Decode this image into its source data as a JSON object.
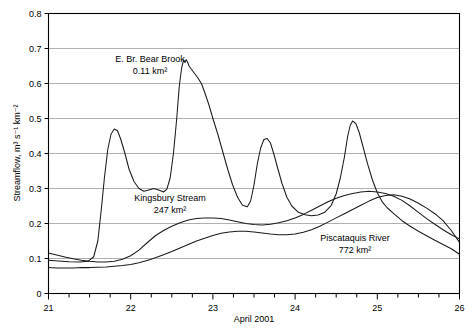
{
  "chart_data": {
    "type": "line",
    "title": "",
    "xlabel": "April 2001",
    "ylabel": "Streamflow, m³ s⁻¹ km⁻²",
    "xlim": [
      21,
      26
    ],
    "ylim": [
      0,
      0.8
    ],
    "xticks": [
      21,
      22,
      23,
      24,
      25,
      26
    ],
    "xtick_labels": [
      "21",
      "22",
      "23",
      "24",
      "25",
      "26"
    ],
    "x_minor_per_major": 4,
    "yticks": [
      0,
      0.1,
      0.2,
      0.3,
      0.4,
      0.5,
      0.6,
      0.7,
      0.8
    ],
    "ytick_labels": [
      "0",
      "0.1",
      "0.2",
      "0.3",
      "0.4",
      "0.5",
      "0.6",
      "0.7",
      "0.8"
    ],
    "grid": "horizontal",
    "legend": "inline-annotations",
    "line_color": "#1a1a1a",
    "grid_color": "#8c8c8c",
    "annotations": [
      {
        "name": "E. Br. Bear Brook",
        "area": "0.11 km²",
        "line1": "E. Br. Bear Brook",
        "line2": "0.11 km²",
        "x_px": 150,
        "y_px": 62
      },
      {
        "name": "Kingsbury Stream",
        "area": "247 km²",
        "line1": "Kingsbury Stream",
        "line2": "247 km²",
        "x_px": 170,
        "y_px": 201
      },
      {
        "name": "Piscataquis River",
        "area": "772 km²",
        "line1": "Piscataquis River",
        "line2": "772 km²",
        "x_px": 355,
        "y_px": 241
      }
    ],
    "series": [
      {
        "name": "E. Br. Bear Brook",
        "area_km2": 0.11,
        "x": [
          21.0,
          21.12,
          21.25,
          21.38,
          21.48,
          21.55,
          21.6,
          21.64,
          21.68,
          21.72,
          21.76,
          21.8,
          21.84,
          21.88,
          21.93,
          21.98,
          22.04,
          22.1,
          22.16,
          22.22,
          22.28,
          22.34,
          22.4,
          22.44,
          22.48,
          22.52,
          22.56,
          22.59,
          22.62,
          22.645,
          22.66,
          22.675,
          22.69,
          22.71,
          22.74,
          22.78,
          22.82,
          22.86,
          22.9,
          22.95,
          23.0,
          23.06,
          23.12,
          23.18,
          23.24,
          23.3,
          23.36,
          23.42,
          23.46,
          23.5,
          23.54,
          23.58,
          23.62,
          23.66,
          23.7,
          23.74,
          23.78,
          23.84,
          23.9,
          23.96,
          24.04,
          24.12,
          24.2,
          24.28,
          24.36,
          24.44,
          24.5,
          24.55,
          24.6,
          24.64,
          24.67,
          24.7,
          24.74,
          24.78,
          24.82,
          24.88,
          24.94,
          25.0,
          25.06,
          25.12,
          25.2,
          25.3,
          25.4,
          25.5,
          25.6,
          25.7,
          25.8,
          25.9,
          26.0
        ],
        "y": [
          0.095,
          0.093,
          0.091,
          0.09,
          0.092,
          0.105,
          0.15,
          0.235,
          0.33,
          0.41,
          0.455,
          0.47,
          0.465,
          0.44,
          0.4,
          0.355,
          0.32,
          0.3,
          0.292,
          0.296,
          0.3,
          0.296,
          0.29,
          0.298,
          0.33,
          0.4,
          0.5,
          0.59,
          0.645,
          0.668,
          0.66,
          0.668,
          0.662,
          0.65,
          0.64,
          0.628,
          0.615,
          0.6,
          0.575,
          0.54,
          0.5,
          0.455,
          0.405,
          0.355,
          0.31,
          0.275,
          0.252,
          0.248,
          0.265,
          0.31,
          0.37,
          0.415,
          0.44,
          0.443,
          0.43,
          0.4,
          0.365,
          0.315,
          0.275,
          0.25,
          0.232,
          0.225,
          0.222,
          0.224,
          0.232,
          0.252,
          0.285,
          0.33,
          0.39,
          0.45,
          0.48,
          0.493,
          0.485,
          0.46,
          0.425,
          0.372,
          0.325,
          0.288,
          0.262,
          0.245,
          0.228,
          0.208,
          0.192,
          0.178,
          0.165,
          0.152,
          0.14,
          0.128,
          0.112
        ]
      },
      {
        "name": "Kingsbury Stream",
        "area_km2": 247,
        "x": [
          21.0,
          21.1,
          21.2,
          21.3,
          21.4,
          21.5,
          21.6,
          21.7,
          21.8,
          21.9,
          22.0,
          22.1,
          22.2,
          22.3,
          22.4,
          22.5,
          22.6,
          22.7,
          22.8,
          22.9,
          23.0,
          23.1,
          23.2,
          23.3,
          23.4,
          23.5,
          23.6,
          23.7,
          23.8,
          23.9,
          24.0,
          24.1,
          24.2,
          24.3,
          24.4,
          24.5,
          24.6,
          24.7,
          24.8,
          24.9,
          25.0,
          25.1,
          25.2,
          25.3,
          25.4,
          25.5,
          25.6,
          25.7,
          25.8,
          25.9,
          26.0
        ],
        "y": [
          0.116,
          0.11,
          0.104,
          0.099,
          0.095,
          0.092,
          0.09,
          0.09,
          0.092,
          0.098,
          0.108,
          0.124,
          0.145,
          0.165,
          0.18,
          0.192,
          0.202,
          0.21,
          0.214,
          0.216,
          0.216,
          0.214,
          0.21,
          0.205,
          0.2,
          0.197,
          0.196,
          0.198,
          0.202,
          0.208,
          0.216,
          0.226,
          0.238,
          0.25,
          0.262,
          0.272,
          0.28,
          0.286,
          0.29,
          0.292,
          0.29,
          0.286,
          0.278,
          0.266,
          0.25,
          0.232,
          0.214,
          0.198,
          0.182,
          0.168,
          0.156
        ]
      },
      {
        "name": "Piscataquis River",
        "area_km2": 772,
        "x": [
          21.0,
          21.1,
          21.2,
          21.3,
          21.4,
          21.5,
          21.6,
          21.7,
          21.8,
          21.9,
          22.0,
          22.1,
          22.2,
          22.3,
          22.4,
          22.5,
          22.6,
          22.7,
          22.8,
          22.9,
          23.0,
          23.1,
          23.2,
          23.3,
          23.4,
          23.5,
          23.6,
          23.7,
          23.8,
          23.9,
          24.0,
          24.1,
          24.2,
          24.3,
          24.4,
          24.5,
          24.6,
          24.7,
          24.8,
          24.9,
          25.0,
          25.1,
          25.2,
          25.3,
          25.4,
          25.5,
          25.6,
          25.7,
          25.8,
          25.9,
          26.0
        ],
        "y": [
          0.074,
          0.073,
          0.073,
          0.073,
          0.074,
          0.074,
          0.075,
          0.076,
          0.078,
          0.08,
          0.083,
          0.088,
          0.094,
          0.102,
          0.111,
          0.12,
          0.13,
          0.14,
          0.15,
          0.158,
          0.166,
          0.172,
          0.176,
          0.178,
          0.178,
          0.176,
          0.173,
          0.17,
          0.168,
          0.168,
          0.17,
          0.175,
          0.182,
          0.192,
          0.204,
          0.216,
          0.228,
          0.24,
          0.252,
          0.264,
          0.274,
          0.28,
          0.282,
          0.278,
          0.27,
          0.258,
          0.244,
          0.228,
          0.208,
          0.18,
          0.146
        ]
      }
    ]
  }
}
